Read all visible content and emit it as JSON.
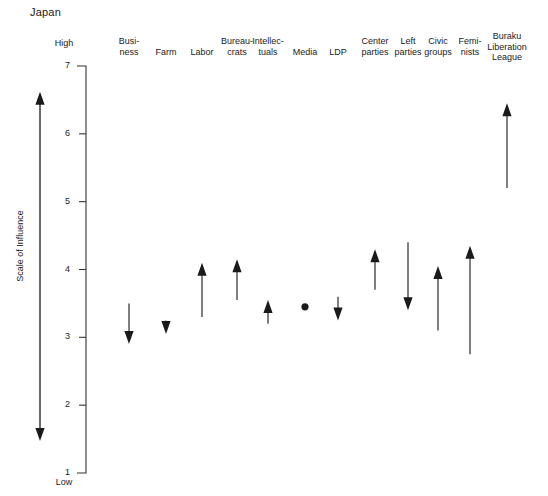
{
  "title": "Japan",
  "axis": {
    "label": "Scale of Influence",
    "high_caption": "High",
    "low_caption": "Low",
    "ticks": [
      "7",
      "6",
      "5",
      "4",
      "3",
      "2",
      "1"
    ]
  },
  "colors": {
    "ink": "#1a1a1a",
    "stroke": "#333333",
    "background": "#ffffff"
  },
  "chart_data": {
    "type": "scatter",
    "title": "Japan",
    "xlabel": "",
    "ylabel": "Scale of Influence",
    "ylim": [
      1,
      7
    ],
    "yticks": [
      1,
      2,
      3,
      4,
      5,
      6,
      7
    ],
    "y_axis_high_label": "High",
    "y_axis_low_label": "Low",
    "grid": false,
    "legend": "none",
    "notation": "Each actor is drawn as an arrow spanning its range of influence; the arrow head marks the direction of change. A dot marks an actor with no change.",
    "categories": [
      "Business",
      "Farm",
      "Labor",
      "Bureaucrats",
      "Intellectuals",
      "Media",
      "LDP",
      "Center parties",
      "Left parties",
      "Civic groups",
      "Feminists",
      "Buraku Liberation League"
    ],
    "series": [
      {
        "name": "range_start",
        "values": [
          3.5,
          3.25,
          3.3,
          3.55,
          3.2,
          3.45,
          3.6,
          3.7,
          4.4,
          3.1,
          2.75,
          5.2
        ]
      },
      {
        "name": "range_end",
        "values": [
          2.9,
          3.05,
          4.1,
          4.15,
          3.55,
          3.45,
          3.25,
          4.3,
          3.4,
          4.05,
          4.35,
          6.45
        ]
      }
    ],
    "points": [
      {
        "label": "Business",
        "header": "Busi-\nness",
        "from": 3.5,
        "to": 2.9,
        "direction": "down",
        "marker": "arrow"
      },
      {
        "label": "Farm",
        "header": "Farm",
        "from": 3.25,
        "to": 3.05,
        "direction": "down",
        "marker": "arrow"
      },
      {
        "label": "Labor",
        "header": "Labor",
        "from": 3.3,
        "to": 4.1,
        "direction": "up",
        "marker": "arrow"
      },
      {
        "label": "Bureaucrats",
        "header": "Bureau-\ncrats",
        "from": 3.55,
        "to": 4.15,
        "direction": "up",
        "marker": "arrow"
      },
      {
        "label": "Intellectuals",
        "header": "Intellec-\ntuals",
        "from": 3.2,
        "to": 3.55,
        "direction": "up",
        "marker": "arrow"
      },
      {
        "label": "Media",
        "header": "Media",
        "from": 3.45,
        "to": 3.45,
        "direction": "none",
        "marker": "dot"
      },
      {
        "label": "LDP",
        "header": "LDP",
        "from": 3.6,
        "to": 3.25,
        "direction": "down",
        "marker": "arrow"
      },
      {
        "label": "Center parties",
        "header": "Center\nparties",
        "from": 3.7,
        "to": 4.3,
        "direction": "up",
        "marker": "arrow"
      },
      {
        "label": "Left parties",
        "header": "Left\nparties",
        "from": 4.4,
        "to": 3.4,
        "direction": "down",
        "marker": "arrow"
      },
      {
        "label": "Civic groups",
        "header": "Civic\ngroups",
        "from": 3.1,
        "to": 4.05,
        "direction": "up",
        "marker": "arrow"
      },
      {
        "label": "Feminists",
        "header": "Femi-\nnists",
        "from": 2.75,
        "to": 4.35,
        "direction": "up",
        "marker": "arrow"
      },
      {
        "label": "Buraku Liberation League",
        "header": "Buraku\nLiberation\nLeague",
        "from": 5.2,
        "to": 6.45,
        "direction": "up",
        "marker": "arrow"
      }
    ]
  },
  "layout": {
    "plot_top_y": 66,
    "plot_bottom_y": 473,
    "axis_x": 86,
    "column_x": [
      129,
      166,
      202,
      237,
      268,
      305,
      338,
      375,
      408,
      438,
      470,
      507
    ],
    "header_top": [
      36,
      47,
      47,
      36,
      36,
      47,
      47,
      36,
      36,
      36,
      36,
      31
    ]
  }
}
